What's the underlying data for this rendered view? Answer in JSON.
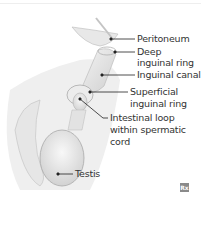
{
  "diagram": {
    "labels": [
      {
        "id": "peritoneum",
        "lines": [
          "Peritoneum"
        ]
      },
      {
        "id": "deep-inguinal-ring",
        "lines": [
          "Deep",
          "inguinal ring"
        ]
      },
      {
        "id": "inguinal-canal",
        "lines": [
          "Inguinal canal"
        ]
      },
      {
        "id": "superficial-inguinal-ring",
        "lines": [
          "Superficial",
          "inguinal ring"
        ]
      },
      {
        "id": "intestinal-loop",
        "lines": [
          "Intestinal loop",
          "within spermatic",
          "cord"
        ]
      },
      {
        "id": "testis",
        "lines": [
          "Testis"
        ]
      }
    ],
    "badge": "Rx",
    "colors": {
      "label_text": "#333333",
      "leader_line": "#222222",
      "tissue": "#e4e4e4",
      "shadow": "#c8c8c8"
    }
  }
}
